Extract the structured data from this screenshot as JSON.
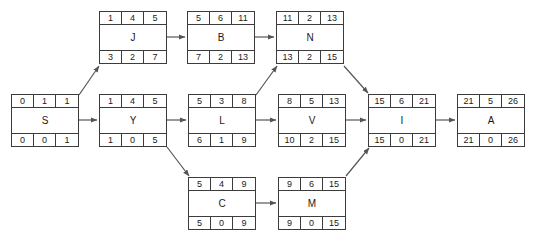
{
  "diagram": {
    "box_width": 68,
    "box_height": 53,
    "nodes": [
      {
        "id": "J",
        "label": "J",
        "x": 99,
        "y": 11,
        "top": [
          "1",
          "4",
          "5"
        ],
        "bottom": [
          "3",
          "2",
          "7"
        ]
      },
      {
        "id": "B",
        "label": "B",
        "x": 187,
        "y": 11,
        "top": [
          "5",
          "6",
          "11"
        ],
        "bottom": [
          "7",
          "2",
          "13"
        ]
      },
      {
        "id": "N",
        "label": "N",
        "x": 276,
        "y": 11,
        "top": [
          "11",
          "2",
          "13"
        ],
        "bottom": [
          "13",
          "2",
          "15"
        ]
      },
      {
        "id": "S",
        "label": "S",
        "x": 11,
        "y": 94,
        "top": [
          "0",
          "1",
          "1"
        ],
        "bottom": [
          "0",
          "0",
          "1"
        ]
      },
      {
        "id": "Y",
        "label": "Y",
        "x": 99,
        "y": 94,
        "top": [
          "1",
          "4",
          "5"
        ],
        "bottom": [
          "1",
          "0",
          "5"
        ]
      },
      {
        "id": "L",
        "label": "L",
        "x": 188,
        "y": 94,
        "top": [
          "5",
          "3",
          "8"
        ],
        "bottom": [
          "6",
          "1",
          "9"
        ]
      },
      {
        "id": "V",
        "label": "V",
        "x": 278,
        "y": 94,
        "top": [
          "8",
          "5",
          "13"
        ],
        "bottom": [
          "10",
          "2",
          "15"
        ]
      },
      {
        "id": "I",
        "label": "I",
        "x": 368,
        "y": 94,
        "top": [
          "15",
          "6",
          "21"
        ],
        "bottom": [
          "15",
          "0",
          "21"
        ]
      },
      {
        "id": "A",
        "label": "A",
        "x": 457,
        "y": 94,
        "top": [
          "21",
          "5",
          "26"
        ],
        "bottom": [
          "21",
          "0",
          "26"
        ]
      },
      {
        "id": "C",
        "label": "C",
        "x": 188,
        "y": 177,
        "top": [
          "5",
          "4",
          "9"
        ],
        "bottom": [
          "5",
          "0",
          "9"
        ]
      },
      {
        "id": "M",
        "label": "M",
        "x": 278,
        "y": 177,
        "top": [
          "9",
          "6",
          "15"
        ],
        "bottom": [
          "9",
          "0",
          "15"
        ]
      }
    ],
    "edges": [
      {
        "from": "S",
        "to": "Y",
        "kind": "horizontal"
      },
      {
        "from": "S",
        "to": "J",
        "kind": "diagonal-up"
      },
      {
        "from": "J",
        "to": "B",
        "kind": "horizontal"
      },
      {
        "from": "B",
        "to": "N",
        "kind": "horizontal"
      },
      {
        "from": "Y",
        "to": "L",
        "kind": "horizontal"
      },
      {
        "from": "Y",
        "to": "C",
        "kind": "diagonal-down"
      },
      {
        "from": "L",
        "to": "V",
        "kind": "horizontal"
      },
      {
        "from": "L",
        "to": "N",
        "kind": "diagonal-up"
      },
      {
        "from": "C",
        "to": "M",
        "kind": "horizontal"
      },
      {
        "from": "V",
        "to": "I",
        "kind": "horizontal"
      },
      {
        "from": "N",
        "to": "I",
        "kind": "diagonal-down"
      },
      {
        "from": "M",
        "to": "I",
        "kind": "diagonal-up"
      },
      {
        "from": "I",
        "to": "A",
        "kind": "horizontal"
      }
    ],
    "colors": {
      "border": "#3c3c3c",
      "text": "#1a1a1a",
      "edge": "#555555",
      "background": "#ffffff"
    }
  }
}
